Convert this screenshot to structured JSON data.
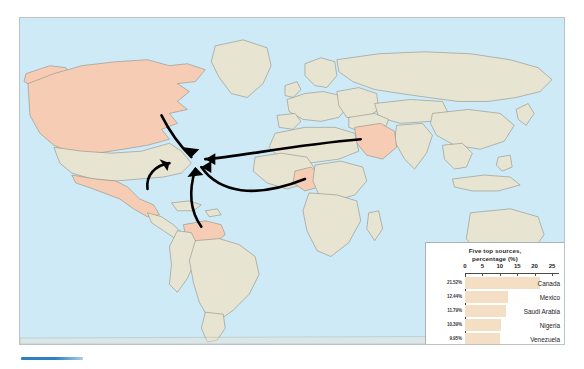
{
  "figure": {
    "kind": "world-map-with-inset-bar-chart",
    "land_color": "#e8e4d2",
    "ocean_color": "#cfeaf7",
    "highlight_color": "#f6cdb4",
    "border_color": "#8d8f86",
    "coastline_color": "#6fb9e0",
    "arrow_color": "#000000"
  },
  "legend": {
    "title_line1": "Five top sources,",
    "title_line2": "percentage (%)"
  },
  "chart_data": {
    "type": "bar",
    "orientation": "horizontal",
    "title": "Five top sources, percentage (%)",
    "xlabel": "",
    "ylabel": "",
    "xlim": [
      0,
      27
    ],
    "grid": false,
    "legend_position": "none",
    "axis_ticks": [
      0,
      5,
      10,
      15,
      20,
      25
    ],
    "tick_labels": [
      "0",
      "5",
      "10",
      "15",
      "20",
      "25"
    ],
    "categories": [
      "Canada",
      "Mexico",
      "Saudi Arabia",
      "Nigeria",
      "Venezuela"
    ],
    "values": [
      21.52,
      12.44,
      11.79,
      10.39,
      9.95
    ],
    "value_labels": [
      "21.52%",
      "12.44%",
      "11.79%",
      "10.39%",
      "9.95%"
    ],
    "bar_color": "#f4dfc4"
  },
  "map": {
    "highlighted_countries": [
      "Canada",
      "Mexico",
      "Saudi Arabia",
      "Nigeria",
      "Venezuela"
    ],
    "destination": "United States",
    "flows": [
      {
        "from": "Canada",
        "to": "United States"
      },
      {
        "from": "Mexico",
        "to": "United States"
      },
      {
        "from": "Venezuela",
        "to": "United States"
      },
      {
        "from": "Nigeria",
        "to": "United States"
      },
      {
        "from": "Saudi Arabia",
        "to": "United States"
      }
    ]
  }
}
